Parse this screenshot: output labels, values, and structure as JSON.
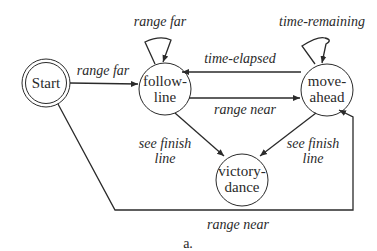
{
  "diagram": {
    "type": "state-machine",
    "caption": "a.",
    "states": [
      {
        "id": "start",
        "label_lines": [
          "Start"
        ],
        "initial": true
      },
      {
        "id": "follow-line",
        "label_lines": [
          "follow-",
          "line"
        ]
      },
      {
        "id": "move-ahead",
        "label_lines": [
          "move-",
          "ahead"
        ]
      },
      {
        "id": "victory-dance",
        "label_lines": [
          "victory-",
          "dance"
        ]
      }
    ],
    "transitions": [
      {
        "from": "start",
        "to": "follow-line",
        "label": "range far"
      },
      {
        "from": "follow-line",
        "to": "follow-line",
        "label": "range far"
      },
      {
        "from": "move-ahead",
        "to": "follow-line",
        "label": "time-elapsed"
      },
      {
        "from": "follow-line",
        "to": "move-ahead",
        "label": "range near"
      },
      {
        "from": "move-ahead",
        "to": "move-ahead",
        "label": "time-remaining"
      },
      {
        "from": "follow-line",
        "to": "victory-dance",
        "label_lines": [
          "see finish",
          "line"
        ]
      },
      {
        "from": "move-ahead",
        "to": "victory-dance",
        "label_lines": [
          "see finish",
          "line"
        ]
      },
      {
        "from": "start",
        "to": "move-ahead",
        "label": "range near"
      }
    ]
  },
  "colors": {
    "stroke": "#2a2a2a",
    "background": "#ffffff"
  }
}
